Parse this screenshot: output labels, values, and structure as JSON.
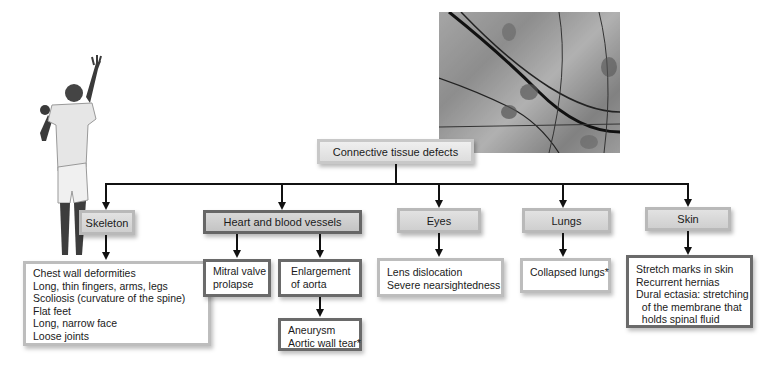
{
  "diagram": {
    "root": {
      "label": "Connective tissue defects"
    },
    "categories": [
      {
        "label": "Skeleton",
        "details": [
          "Chest wall deformities",
          "Long, thin fingers, arms, legs",
          "Scoliosis (curvature of the spine)",
          "Flat feet",
          "Long, narrow face",
          "Loose joints"
        ]
      },
      {
        "label": "Heart and blood vessels",
        "subitems": [
          {
            "label": [
              "Mitral valve",
              "prolapse"
            ]
          },
          {
            "label": [
              "Enlargement",
              "of aorta"
            ],
            "details": [
              "Aneurysm",
              "Aortic wall tear*"
            ]
          }
        ]
      },
      {
        "label": "Eyes",
        "details": [
          "Lens dislocation",
          "Severe nearsightedness"
        ]
      },
      {
        "label": "Lungs",
        "details": [
          "Collapsed lungs*"
        ]
      },
      {
        "label": "Skin",
        "details": [
          "Stretch marks in skin",
          "Recurrent hernias",
          "Dural ectasia: stretching",
          "  of the membrane that",
          "  holds spinal fluid"
        ]
      }
    ]
  },
  "images": {
    "person_photo": "tall-athlete-photo",
    "micrograph": "connective-tissue-micrograph"
  }
}
